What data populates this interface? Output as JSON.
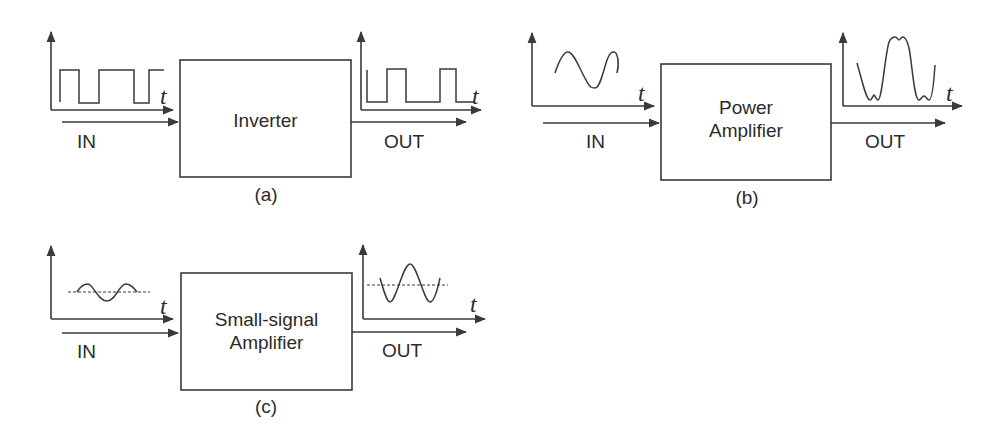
{
  "figure": {
    "panels": [
      {
        "id": "a",
        "caption": "(a)",
        "block_label_lines": [
          "Inverter"
        ],
        "input_label": "IN",
        "output_label": "OUT",
        "time_axis_label": "t",
        "input_waveform": "square-wave",
        "output_waveform": "inverted-square-wave"
      },
      {
        "id": "b",
        "caption": "(b)",
        "block_label_lines": [
          "Power",
          "Amplifier"
        ],
        "input_label": "IN",
        "output_label": "OUT",
        "time_axis_label": "t",
        "input_waveform": "sine-wave",
        "output_waveform": "distorted-amplified-wave"
      },
      {
        "id": "c",
        "caption": "(c)",
        "block_label_lines": [
          "Small-signal",
          "Amplifier"
        ],
        "input_label": "IN",
        "output_label": "OUT",
        "time_axis_label": "t",
        "input_waveform": "small-sine-with-dc-level",
        "output_waveform": "amplified-sine-with-dc-level"
      }
    ],
    "colors": {
      "line": "#3a3a3a",
      "text": "#2b2b2b",
      "background": "#ffffff"
    }
  }
}
